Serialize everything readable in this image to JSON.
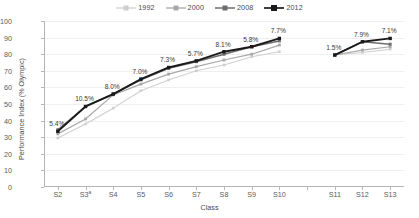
{
  "chart_data": {
    "type": "line",
    "title": "",
    "xlabel": "Class",
    "ylabel": "Performance Index (% Olympic)",
    "ylim": [
      0,
      100
    ],
    "ytick_values": [
      0,
      10,
      20,
      30,
      40,
      50,
      60,
      70,
      80,
      90,
      100
    ],
    "ytick_labels": [
      "0",
      "10",
      "20",
      "30",
      "40",
      "50",
      "60",
      "70",
      "80",
      "90",
      "100"
    ],
    "grid": true,
    "legend_position": "top-center",
    "categories": [
      "S2",
      "S3",
      "S4",
      "S5",
      "S6",
      "S7",
      "S8",
      "S9",
      "S10",
      "",
      "S11",
      "S12",
      "S13"
    ],
    "category_labels": [
      "S2",
      "S3a",
      "S4",
      "S5",
      "S6",
      "S7",
      "S8",
      "S9",
      "S10",
      "",
      "S11",
      "S12",
      "S13"
    ],
    "category_footnote_marks": {
      "S3": "a"
    },
    "gap_after_category": "S10",
    "series": [
      {
        "name": "1992",
        "color": "#cfcfcf",
        "values": [
          29.5,
          38.0,
          47.5,
          58.0,
          64.5,
          70.0,
          73.5,
          78.5,
          81.5,
          null,
          79.5,
          81.0,
          83.0
        ]
      },
      {
        "name": "2000",
        "color": "#a8a8a8",
        "values": [
          32.0,
          41.0,
          55.5,
          62.0,
          68.0,
          72.5,
          76.5,
          80.0,
          85.5,
          null,
          79.5,
          82.5,
          84.5
        ]
      },
      {
        "name": "2008",
        "color": "#6e6e6e",
        "values": [
          34.5,
          48.5,
          56.0,
          64.5,
          71.5,
          75.5,
          80.0,
          84.5,
          88.0,
          null,
          79.5,
          87.5,
          86.0
        ]
      },
      {
        "name": "2012",
        "color": "#1a1a1a",
        "values": [
          33.5,
          48.5,
          56.0,
          65.0,
          72.0,
          76.0,
          81.5,
          84.5,
          89.5,
          null,
          79.5,
          87.5,
          89.5
        ]
      }
    ],
    "annotations": [
      {
        "category": "S2",
        "text": "5.4%"
      },
      {
        "category": "S3",
        "text": "10.5%"
      },
      {
        "category": "S4",
        "text": "8.0%"
      },
      {
        "category": "S5",
        "text": "7.0%"
      },
      {
        "category": "S6",
        "text": "7.3%"
      },
      {
        "category": "S7",
        "text": "5.7%"
      },
      {
        "category": "S8",
        "text": "8.1%"
      },
      {
        "category": "S9",
        "text": "5.8%"
      },
      {
        "category": "S10",
        "text": "7.7%"
      },
      {
        "category": "S11",
        "text": "1.5%"
      },
      {
        "category": "S12",
        "text": "7.9%"
      },
      {
        "category": "S13",
        "text": "7.1%"
      }
    ]
  }
}
